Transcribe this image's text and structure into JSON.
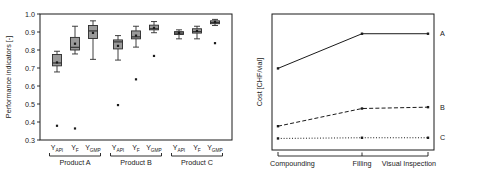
{
  "chart_data": [
    {
      "type": "box",
      "panel": "left",
      "title": "",
      "xlabel": "",
      "ylabel": "Performance indicators [-]",
      "ylim": [
        0.3,
        1.0
      ],
      "ytick_labels": [
        "0.3",
        "0.4",
        "0.5",
        "0.6",
        "0.7",
        "0.8",
        "0.9",
        "1.0"
      ],
      "ytick_values": [
        0.3,
        0.4,
        0.5,
        0.6,
        0.7,
        0.8,
        0.9,
        1.0
      ],
      "grid": false,
      "categories": [
        "Y_API",
        "Y_F",
        "Y_GMP",
        "Y_API",
        "Y_F",
        "Y_GMP",
        "Y_API",
        "Y_F",
        "Y_GMP"
      ],
      "category_base": [
        "Y",
        "Y",
        "Y",
        "Y",
        "Y",
        "Y",
        "Y",
        "Y",
        "Y"
      ],
      "category_sub": [
        "API",
        "F",
        "GMP",
        "API",
        "F",
        "GMP",
        "API",
        "F",
        "GMP"
      ],
      "groups": [
        {
          "label": "Product A",
          "members": [
            0,
            1,
            2
          ]
        },
        {
          "label": "Product B",
          "members": [
            3,
            4,
            5
          ]
        },
        {
          "label": "Product C",
          "members": [
            6,
            7,
            8
          ]
        }
      ],
      "boxes": [
        {
          "name": "Product A Y_API",
          "whisker_low": 0.678,
          "q1": 0.712,
          "median": 0.728,
          "q3": 0.775,
          "whisker_high": 0.793,
          "mean": 0.731,
          "outliers": [
            0.379
          ]
        },
        {
          "name": "Product A Y_F",
          "whisker_low": 0.778,
          "q1": 0.8,
          "median": 0.815,
          "q3": 0.87,
          "whisker_high": 0.932,
          "mean": 0.835,
          "outliers": [
            0.364
          ]
        },
        {
          "name": "Product A Y_GMP",
          "whisker_low": 0.748,
          "q1": 0.864,
          "median": 0.906,
          "q3": 0.936,
          "whisker_high": 0.962,
          "mean": 0.895,
          "outliers": []
        },
        {
          "name": "Product B Y_API",
          "whisker_low": 0.744,
          "q1": 0.806,
          "median": 0.845,
          "q3": 0.856,
          "whisker_high": 0.88,
          "mean": 0.823,
          "outliers": [
            0.494
          ]
        },
        {
          "name": "Product B Y_F",
          "whisker_low": 0.816,
          "q1": 0.862,
          "median": 0.873,
          "q3": 0.906,
          "whisker_high": 0.932,
          "mean": 0.88,
          "outliers": [
            0.637
          ]
        },
        {
          "name": "Product B Y_GMP",
          "whisker_low": 0.896,
          "q1": 0.912,
          "median": 0.918,
          "q3": 0.938,
          "whisker_high": 0.958,
          "mean": 0.923,
          "outliers": [
            0.767
          ]
        },
        {
          "name": "Product C Y_API",
          "whisker_low": 0.862,
          "q1": 0.886,
          "median": 0.894,
          "q3": 0.902,
          "whisker_high": 0.912,
          "mean": 0.895,
          "outliers": []
        },
        {
          "name": "Product C Y_F",
          "whisker_low": 0.862,
          "q1": 0.894,
          "median": 0.902,
          "q3": 0.918,
          "whisker_high": 0.932,
          "mean": 0.906,
          "outliers": []
        },
        {
          "name": "Product C Y_GMP",
          "whisker_low": 0.936,
          "q1": 0.946,
          "median": 0.952,
          "q3": 0.962,
          "whisker_high": 0.97,
          "mean": 0.955,
          "outliers": [
            0.838
          ]
        }
      ]
    },
    {
      "type": "line",
      "panel": "right",
      "title": "",
      "xlabel": "",
      "ylabel": "Cost [CHF/vial]",
      "grid": false,
      "ylim": [
        0,
        1
      ],
      "x": [
        "Compounding",
        "Filling",
        "Visual Inspection"
      ],
      "series": [
        {
          "name": "A",
          "label": "A",
          "style": "solid",
          "values": [
            0.6,
            0.855,
            0.855
          ]
        },
        {
          "name": "B",
          "label": "B",
          "style": "dashed",
          "values": [
            0.175,
            0.305,
            0.315
          ]
        },
        {
          "name": "C",
          "label": "C",
          "style": "dotted",
          "values": [
            0.085,
            0.09,
            0.09
          ]
        }
      ],
      "series_label_position": "right-of-axis"
    }
  ]
}
